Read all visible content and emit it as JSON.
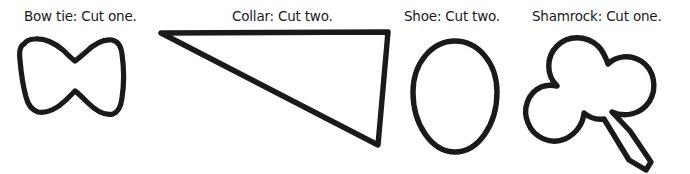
{
  "page": {
    "background_color": "#ffffff",
    "ink_color": "#1a1a1a",
    "width": 690,
    "height": 174
  },
  "templates": [
    {
      "id": "bow-tie",
      "label": "Bow tie: Cut one.",
      "item_name": "Bow tie",
      "instruction": "Cut one.",
      "quantity": 1,
      "shape": "bow-tie-outline"
    },
    {
      "id": "collar",
      "label": "Collar: Cut two.",
      "item_name": "Collar",
      "instruction": "Cut two.",
      "quantity": 2,
      "shape": "triangle-outline"
    },
    {
      "id": "shoe",
      "label": "Shoe: Cut two.",
      "item_name": "Shoe",
      "instruction": "Cut two.",
      "quantity": 2,
      "shape": "oval-outline"
    },
    {
      "id": "shamrock",
      "label": "Shamrock: Cut one.",
      "item_name": "Shamrock",
      "instruction": "Cut one.",
      "quantity": 1,
      "shape": "shamrock-outline"
    }
  ]
}
